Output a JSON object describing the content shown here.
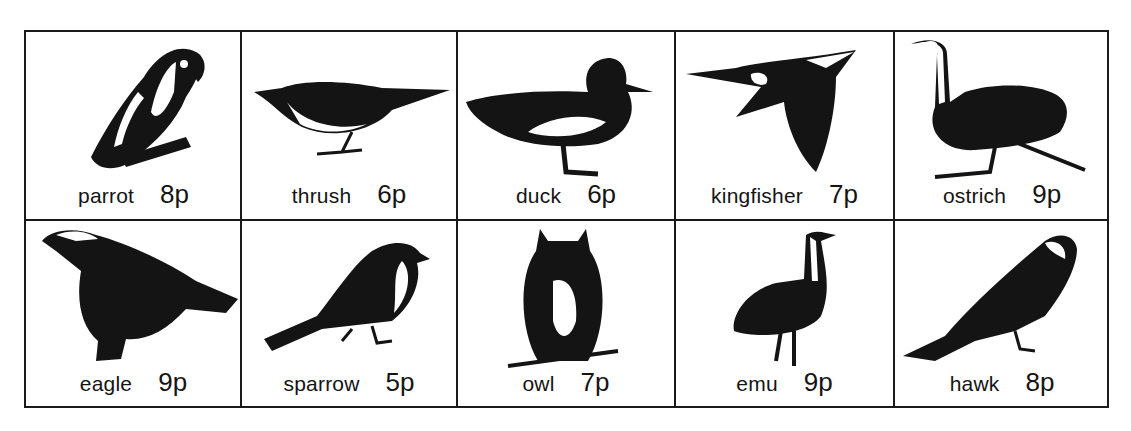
{
  "birds": [
    {
      "name": "parrot",
      "price": "8p"
    },
    {
      "name": "thrush",
      "price": "6p"
    },
    {
      "name": "duck",
      "price": "6p"
    },
    {
      "name": "kingfisher",
      "price": "7p"
    },
    {
      "name": "ostrich",
      "price": "9p"
    },
    {
      "name": "eagle",
      "price": "9p"
    },
    {
      "name": "sparrow",
      "price": "5p"
    },
    {
      "name": "owl",
      "price": "7p"
    },
    {
      "name": "emu",
      "price": "9p"
    },
    {
      "name": "hawk",
      "price": "8p"
    }
  ],
  "colors": {
    "ink": "#141414",
    "paper": "#ffffff"
  }
}
